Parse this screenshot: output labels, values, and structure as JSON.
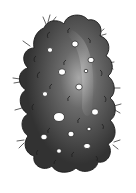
{
  "image": {
    "subject": "dark bumpy berry-like illustration with white spots and small hairs",
    "width": 136,
    "height": 193
  },
  "colors": {
    "background": "#ffffff",
    "body_dark": "#2e2e2e",
    "body_mid": "#4a4a4a",
    "highlight": "#a8a8a8",
    "outline": "#1a1a1a",
    "spot": "#ffffff",
    "hair": "#3a3a3a"
  },
  "shape": {
    "bbox": {
      "x": 17,
      "y": 14,
      "w": 101,
      "h": 158
    }
  },
  "spots": [
    {
      "cx": 75,
      "cy": 44,
      "rx": 3.2,
      "ry": 3
    },
    {
      "cx": 50,
      "cy": 50,
      "rx": 2.6,
      "ry": 2.4
    },
    {
      "cx": 91,
      "cy": 60,
      "rx": 3,
      "ry": 2.7
    },
    {
      "cx": 62,
      "cy": 72,
      "rx": 3.6,
      "ry": 3.2
    },
    {
      "cx": 86,
      "cy": 71,
      "rx": 1.8,
      "ry": 1.7
    },
    {
      "cx": 79,
      "cy": 87,
      "rx": 3.2,
      "ry": 2.9
    },
    {
      "cx": 45,
      "cy": 94,
      "rx": 2.6,
      "ry": 2.4
    },
    {
      "cx": 95,
      "cy": 112,
      "rx": 3.5,
      "ry": 3.2
    },
    {
      "cx": 59,
      "cy": 117,
      "rx": 5.5,
      "ry": 4.5
    },
    {
      "cx": 71,
      "cy": 134,
      "rx": 3,
      "ry": 2.8
    },
    {
      "cx": 89,
      "cy": 129,
      "rx": 2,
      "ry": 1.8
    },
    {
      "cx": 44,
      "cy": 137,
      "rx": 3.2,
      "ry": 2.8
    },
    {
      "cx": 87,
      "cy": 146,
      "rx": 3.4,
      "ry": 2.6
    },
    {
      "cx": 59,
      "cy": 151,
      "rx": 2.4,
      "ry": 2.2
    }
  ]
}
